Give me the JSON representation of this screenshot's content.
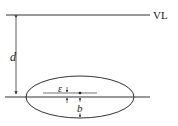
{
  "diagram": {
    "labels": {
      "level_line": "VL",
      "depth": "d",
      "epsilon": "ε",
      "semi_axis": "b"
    },
    "colors": {
      "stroke": "#333333",
      "background": "#ffffff"
    }
  }
}
